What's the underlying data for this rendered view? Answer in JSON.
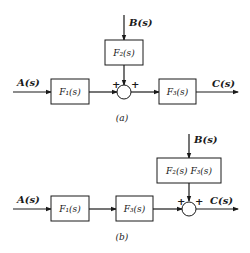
{
  "diagram_a": {
    "caption": "(a)",
    "input": "A(s)",
    "disturbance": "B(s)",
    "output": "C(s)",
    "blocks": [
      {
        "id": "F1",
        "label": "F₁(s)"
      },
      {
        "id": "F2",
        "label": "F₂(s)"
      },
      {
        "id": "F3",
        "label": "F₃(s)"
      }
    ],
    "summing_junction": {
      "left_sign": "+",
      "top_sign": "+"
    }
  },
  "diagram_b": {
    "caption": "(b)",
    "input": "A(s)",
    "disturbance": "B(s)",
    "output": "C(s)",
    "blocks": [
      {
        "id": "F1",
        "label": "F₁(s)"
      },
      {
        "id": "F3",
        "label": "F₃(s)"
      },
      {
        "id": "F2F3",
        "label": "F₂(s) F₃(s)"
      }
    ],
    "summing_junction": {
      "left_sign": "+",
      "top_sign": "+"
    }
  }
}
